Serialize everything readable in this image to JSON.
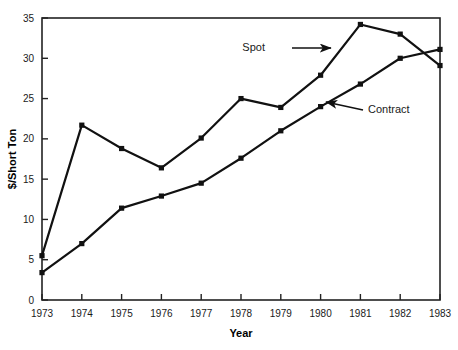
{
  "chart_data": {
    "type": "line",
    "title": "",
    "xlabel": "Year",
    "ylabel": "$/Short Ton",
    "x": [
      1973,
      1974,
      1975,
      1976,
      1977,
      1978,
      1979,
      1980,
      1981,
      1982,
      1983
    ],
    "xtick_labels": [
      "1973",
      "1974",
      "1975",
      "1976",
      "1977",
      "1978",
      "1979",
      "1980",
      "1981",
      "1982",
      "1983"
    ],
    "ytick_labels": [
      "0",
      "5",
      "10",
      "15",
      "20",
      "25",
      "30",
      "35"
    ],
    "yticks": [
      0,
      5,
      10,
      15,
      20,
      25,
      30,
      35
    ],
    "ylim": [
      0,
      35
    ],
    "xlim": [
      1973,
      1983
    ],
    "grid": false,
    "legend_position": "inline-annotations",
    "series": [
      {
        "name": "Spot",
        "values": [
          5.5,
          21.7,
          18.8,
          16.4,
          20.1,
          25.0,
          23.9,
          27.9,
          34.2,
          33.0,
          29.1
        ],
        "color": "#111111",
        "marker": "square"
      },
      {
        "name": "Contract",
        "values": [
          3.4,
          7.0,
          11.4,
          12.9,
          14.5,
          17.6,
          21.0,
          24.0,
          26.8,
          30.0,
          31.1
        ],
        "color": "#111111",
        "marker": "square"
      }
    ],
    "annotations": [
      {
        "text": "Spot",
        "label_x": 265,
        "label_y": 51,
        "arrow_from_x": 292,
        "arrow_from_y": 48,
        "arrow_to_x": 331,
        "arrow_to_y": 48
      },
      {
        "text": "Contract",
        "label_x": 368,
        "label_y": 113,
        "arrow_from_x": 363,
        "arrow_from_y": 110,
        "arrow_to_x": 326,
        "arrow_to_y": 102
      }
    ]
  },
  "axes": {
    "x_title": "Year",
    "y_title": "$/Short Ton"
  }
}
